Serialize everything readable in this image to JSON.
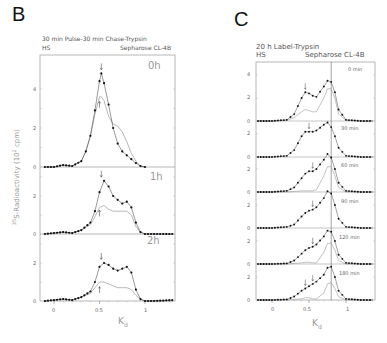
{
  "panels": {
    "B": {
      "letter": "B",
      "title": "30 min Pulse-30 min Chase-Trypsin",
      "left_label": "HS",
      "right_label": "Sepharose CL-4B",
      "ylabel": "35S-Radioactivity (10² cpm)",
      "ylabel_sup": "35",
      "ylabel_main": "S-Radioactivity (10",
      "ylabel_exp": "2",
      "ylabel_end": " cpm)",
      "xlabel": "K",
      "xlabel_sub": "d",
      "xticks": [
        "0",
        "0.5",
        "1"
      ],
      "subplots": [
        {
          "tag": "0h",
          "yticks": [
            "0",
            "2",
            "4"
          ]
        },
        {
          "tag": "1h",
          "yticks": [
            "0",
            "2"
          ]
        },
        {
          "tag": "2h",
          "yticks": [
            "0",
            "2"
          ]
        }
      ]
    },
    "C": {
      "letter": "C",
      "title": "20 h Label-Trypsin",
      "left_label": "HS",
      "right_label": "Sepharose CL-4B",
      "xlabel": "K",
      "xlabel_sub": "d",
      "xticks": [
        "0",
        "0.5",
        "1"
      ],
      "subplots": [
        {
          "tag": "0 min",
          "yticks": [
            "0",
            "2",
            "4"
          ]
        },
        {
          "tag": "30 min",
          "yticks": [
            "0",
            "2"
          ]
        },
        {
          "tag": "60 min",
          "yticks": [
            "0",
            "2"
          ]
        },
        {
          "tag": "90 min",
          "yticks": [
            "0",
            "2"
          ]
        },
        {
          "tag": "120 min",
          "yticks": [
            "0",
            "2"
          ]
        },
        {
          "tag": "180 min",
          "yticks": [
            "0",
            "2"
          ]
        }
      ]
    }
  },
  "chart_data": [
    {
      "type": "line",
      "title": "B: 30 min Pulse-30 min Chase-Trypsin (HS, Sepharose CL-4B)",
      "xlabel": "Kd",
      "ylabel": "35S-Radioactivity (10^2 cpm)",
      "xlim": [
        -0.1,
        1.35
      ],
      "grid": false,
      "panels": [
        {
          "name": "0h",
          "ylim": [
            0,
            5.5
          ],
          "x": [
            -0.1,
            0.0,
            0.1,
            0.2,
            0.3,
            0.35,
            0.4,
            0.45,
            0.5,
            0.52,
            0.55,
            0.6,
            0.65,
            0.7,
            0.75,
            0.8,
            0.85,
            0.9,
            0.95,
            1.0
          ],
          "series": [
            {
              "name": "total (dots)",
              "values": [
                0,
                0,
                0.1,
                0.05,
                0.3,
                0.8,
                1.6,
                2.9,
                4.4,
                4.8,
                4.3,
                3.2,
                2.0,
                1.2,
                0.8,
                0.6,
                0.4,
                0.2,
                0.05,
                0
              ]
            },
            {
              "name": "trypsin-resistant (line)",
              "values": [
                0,
                0,
                0.1,
                0.05,
                0.3,
                0.8,
                1.6,
                2.7,
                3.6,
                3.6,
                3.4,
                2.6,
                2.2,
                2.1,
                1.8,
                1.3,
                0.7,
                0.3,
                0.05,
                0
              ]
            }
          ],
          "arrows_kd": [
            0.52,
            0.5
          ]
        },
        {
          "name": "1h",
          "ylim": [
            0,
            3.5
          ],
          "x": [
            -0.1,
            0.0,
            0.1,
            0.2,
            0.3,
            0.4,
            0.45,
            0.5,
            0.55,
            0.6,
            0.65,
            0.7,
            0.75,
            0.8,
            0.85,
            0.9,
            0.95,
            1.0,
            1.1,
            1.3
          ],
          "series": [
            {
              "name": "total (dots)",
              "values": [
                0,
                0.05,
                0.1,
                0.05,
                0.2,
                0.6,
                1.2,
                2.2,
                2.8,
                2.5,
                2.0,
                1.8,
                1.6,
                1.7,
                1.4,
                0.6,
                0.1,
                0,
                0,
                0
              ]
            },
            {
              "name": "trypsin-resistant (line)",
              "values": [
                0,
                0.05,
                0.1,
                0.05,
                0.2,
                0.5,
                0.9,
                1.4,
                1.5,
                1.3,
                1.2,
                1.2,
                1.2,
                1.2,
                1.0,
                0.4,
                0.1,
                0,
                0,
                0
              ]
            }
          ],
          "arrows_kd": [
            0.52,
            0.5
          ]
        },
        {
          "name": "2h",
          "ylim": [
            0,
            3
          ],
          "x": [
            -0.1,
            0.0,
            0.1,
            0.2,
            0.3,
            0.4,
            0.45,
            0.5,
            0.55,
            0.6,
            0.65,
            0.7,
            0.75,
            0.8,
            0.85,
            0.9,
            0.95,
            1.0,
            1.1,
            1.3
          ],
          "series": [
            {
              "name": "total (dots)",
              "values": [
                0,
                0.05,
                0.1,
                0.05,
                0.2,
                0.5,
                1.0,
                1.8,
                2.0,
                1.9,
                1.7,
                1.6,
                1.7,
                1.8,
                1.5,
                0.6,
                0.1,
                0,
                0,
                0.05
              ]
            },
            {
              "name": "trypsin-resistant (line)",
              "values": [
                0,
                0.05,
                0.1,
                0.05,
                0.2,
                0.4,
                0.7,
                1.0,
                1.0,
                0.9,
                0.8,
                0.7,
                0.7,
                0.7,
                0.6,
                0.3,
                0.1,
                0,
                0,
                0
              ]
            }
          ],
          "arrows_kd": [
            0.55,
            0.5
          ]
        }
      ]
    },
    {
      "type": "line",
      "title": "C: 20 h Label-Trypsin (HS, Sepharose CL-4B)",
      "xlabel": "Kd",
      "ylabel": "35S-Radioactivity (10^2 cpm)",
      "xlim": [
        -0.2,
        1.4
      ],
      "vertical_line_kd": 0.8,
      "grid": false,
      "panels": [
        {
          "name": "0 min",
          "ylim": [
            0,
            5
          ],
          "x": [
            -0.2,
            0.0,
            0.2,
            0.3,
            0.4,
            0.45,
            0.5,
            0.55,
            0.6,
            0.7,
            0.75,
            0.8,
            0.85,
            0.9,
            1.0,
            1.2,
            1.4
          ],
          "series": [
            {
              "name": "total (dots)",
              "values": [
                0,
                0,
                0.1,
                0.6,
                2.0,
                2.5,
                2.4,
                2.2,
                2.1,
                3.0,
                3.5,
                3.4,
                2.5,
                1.0,
                0.1,
                0,
                0
              ]
            },
            {
              "name": "trypsin-resistant (line)",
              "values": [
                0,
                0,
                0.05,
                0.3,
                0.8,
                1.0,
                0.9,
                0.8,
                0.8,
                2.0,
                2.8,
                2.8,
                2.0,
                0.6,
                0.05,
                0,
                0
              ]
            }
          ],
          "arrows_kd": [
            0.45
          ]
        },
        {
          "name": "30 min",
          "ylim": [
            0,
            3
          ],
          "x": [
            -0.2,
            0.0,
            0.2,
            0.3,
            0.4,
            0.45,
            0.5,
            0.55,
            0.6,
            0.7,
            0.75,
            0.8,
            0.85,
            0.9,
            1.0,
            1.2,
            1.4
          ],
          "series": [
            {
              "name": "total (dots)",
              "values": [
                0,
                0,
                0.1,
                0.6,
                1.8,
                2.2,
                2.2,
                2.2,
                2.3,
                2.8,
                3.0,
                2.6,
                1.8,
                0.8,
                0.1,
                0,
                0
              ]
            }
          ],
          "arrows_kd": [
            0.5
          ]
        },
        {
          "name": "60 min",
          "ylim": [
            0,
            3
          ],
          "x": [
            -0.2,
            0.0,
            0.2,
            0.3,
            0.4,
            0.45,
            0.5,
            0.55,
            0.6,
            0.7,
            0.75,
            0.8,
            0.85,
            0.9,
            1.0,
            1.2,
            1.4
          ],
          "series": [
            {
              "name": "total (dots)",
              "values": [
                0,
                0,
                0.1,
                0.4,
                1.2,
                1.6,
                1.8,
                1.8,
                2.0,
                2.8,
                3.3,
                3.0,
                2.0,
                0.8,
                0.1,
                0,
                0
              ]
            },
            {
              "name": "trypsin-resistant (line)",
              "values": [
                0,
                0,
                0,
                0.05,
                0.1,
                0.1,
                0.1,
                0.1,
                0.2,
                1.4,
                2.2,
                2.2,
                1.4,
                0.4,
                0,
                0,
                0
              ]
            }
          ],
          "arrows_kd": [
            0.55
          ]
        },
        {
          "name": "90 min",
          "ylim": [
            0,
            3
          ],
          "x": [
            -0.2,
            0.0,
            0.2,
            0.3,
            0.4,
            0.45,
            0.5,
            0.55,
            0.6,
            0.7,
            0.75,
            0.8,
            0.85,
            0.9,
            1.0,
            1.2,
            1.4
          ],
          "series": [
            {
              "name": "total (dots)",
              "values": [
                0,
                0,
                0.1,
                0.3,
                1.0,
                1.3,
                1.5,
                1.6,
                1.8,
                2.6,
                3.2,
                3.0,
                2.0,
                0.8,
                0.1,
                0,
                0
              ]
            }
          ],
          "arrows_kd": [
            0.55
          ]
        },
        {
          "name": "120 min",
          "ylim": [
            0,
            3
          ],
          "x": [
            -0.2,
            0.0,
            0.2,
            0.3,
            0.4,
            0.45,
            0.5,
            0.55,
            0.6,
            0.7,
            0.75,
            0.8,
            0.85,
            0.9,
            1.0,
            1.2,
            1.4
          ],
          "series": [
            {
              "name": "total (dots)",
              "values": [
                0,
                0,
                0.05,
                0.3,
                0.9,
                1.2,
                1.4,
                1.5,
                1.7,
                2.4,
                2.9,
                2.8,
                2.0,
                0.8,
                0.1,
                0,
                0
              ]
            },
            {
              "name": "trypsin-resistant (line)",
              "values": [
                0,
                0,
                0,
                0.05,
                0.1,
                0.15,
                0.15,
                0.1,
                0.1,
                1.0,
                1.8,
                1.8,
                1.2,
                0.3,
                0,
                0,
                0
              ]
            }
          ],
          "arrows_kd": [
            0.55
          ]
        },
        {
          "name": "180 min",
          "ylim": [
            0,
            3
          ],
          "x": [
            -0.2,
            0.0,
            0.2,
            0.3,
            0.4,
            0.45,
            0.5,
            0.55,
            0.6,
            0.7,
            0.75,
            0.8,
            0.85,
            0.9,
            1.0,
            1.2,
            1.4
          ],
          "series": [
            {
              "name": "total (dots)",
              "values": [
                0,
                0,
                0.05,
                0.3,
                0.8,
                1.0,
                1.2,
                1.4,
                1.6,
                2.2,
                2.8,
                2.9,
                2.0,
                0.8,
                0.1,
                0,
                0
              ]
            },
            {
              "name": "trypsin-resistant (line)",
              "values": [
                0,
                0,
                0,
                0.05,
                0.1,
                0.2,
                0.2,
                0.1,
                0.1,
                0.6,
                1.4,
                1.5,
                1.0,
                0.3,
                0,
                0,
                0
              ]
            }
          ],
          "arrows_kd": [
            0.45,
            0.55
          ]
        }
      ]
    }
  ]
}
